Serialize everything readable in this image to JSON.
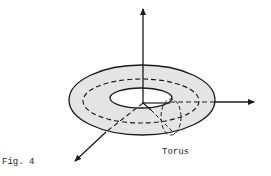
{
  "figure": {
    "caption": "Fig. 4",
    "object_label": "Torus",
    "colors": {
      "fill": "#e4e4e4",
      "stroke": "#1a1a1a",
      "background": "#ffffff"
    }
  }
}
